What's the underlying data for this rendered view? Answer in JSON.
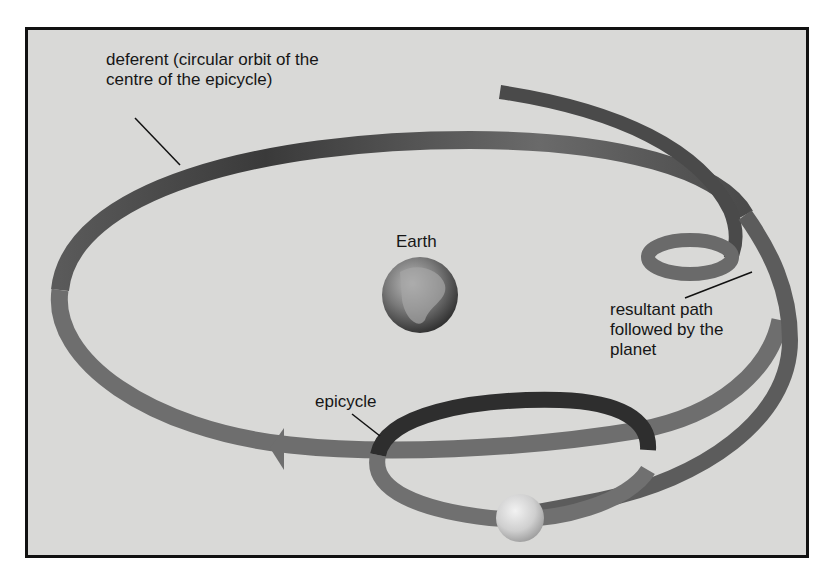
{
  "diagram": {
    "type": "epicycle-model",
    "labels": {
      "deferent": "deferent (circular orbit of the\ncentre of the epicycle)",
      "earth": "Earth",
      "resultant_path": "resultant path\nfollowed by the\nplanet",
      "epicycle": "epicycle"
    },
    "elements": [
      "deferent-ribbon",
      "epicycle-loop",
      "small-loop",
      "earth-globe",
      "planet-sphere",
      "direction-arrow"
    ],
    "colors": {
      "background": "#d9d9d7",
      "ribbon_dark": "#3a3a3a",
      "ribbon_mid": "#6e6e6e",
      "ribbon_light": "#9a9a9a",
      "frame": "#111111"
    }
  }
}
